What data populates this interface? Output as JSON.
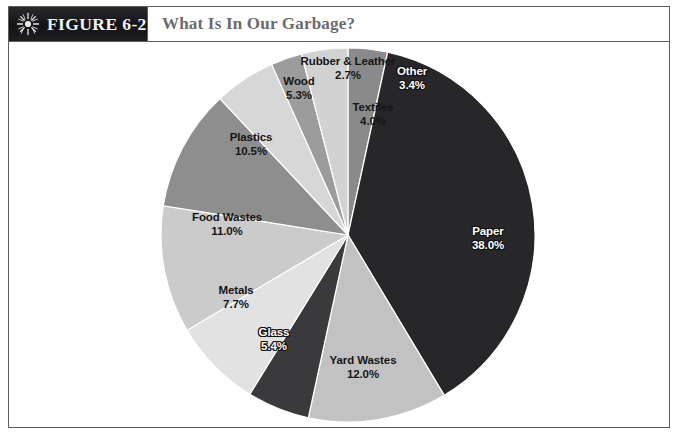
{
  "figure": {
    "tag_prefix": "F",
    "tag_label": "IGURE 6-2",
    "tag_full": "Figure 6-2",
    "title": "What Is In Our Garbage?",
    "icon": "sunburst-icon"
  },
  "colors": {
    "frame": "#5d5d5d",
    "tag_background": "#17171a",
    "tag_text": "#f2f2f2",
    "title_text": "#6b6b6b",
    "page_background": "#ffffff"
  },
  "chart_data": {
    "type": "pie",
    "title": "What Is In Our Garbage?",
    "xlabel": "",
    "ylabel": "",
    "units": "percent",
    "start_angle_deg": 0,
    "direction": "clockwise",
    "legend": "none",
    "labels_inline": true,
    "categories": [
      "Other",
      "Paper",
      "Yard Wastes",
      "Glass",
      "Metals",
      "Food Wastes",
      "Plastics",
      "Wood",
      "Rubber & Leather",
      "Textiles"
    ],
    "values": [
      3.4,
      38.0,
      12.0,
      5.4,
      7.7,
      11.0,
      10.5,
      5.3,
      2.7,
      4.0
    ],
    "total": 100.0,
    "slices": [
      {
        "name": "Other",
        "value": 3.4,
        "value_label": "3.4%",
        "color": "#8a8a8a",
        "label_on_dark": true,
        "label_x": 404,
        "label_y": 36,
        "line2": "3.4%"
      },
      {
        "name": "Paper",
        "value": 38.0,
        "value_label": "38.0%",
        "color": "#27272a",
        "label_on_dark": true,
        "label_x": 480,
        "label_y": 196,
        "line2": "38.0%"
      },
      {
        "name": "Yard Wastes",
        "value": 12.0,
        "value_label": "12.0%",
        "color": "#c2c2c2",
        "label_on_dark": false,
        "label_x": 355,
        "label_y": 325,
        "line2": "12.0%"
      },
      {
        "name": "Glass",
        "value": 5.4,
        "value_label": "5.4%",
        "color": "#3a3a3c",
        "label_on_dark": true,
        "label_x": 266,
        "label_y": 297,
        "line2": "5.4%"
      },
      {
        "name": "Metals",
        "value": 7.7,
        "value_label": "7.7%",
        "color": "#e2e2e2",
        "label_on_dark": false,
        "label_x": 228,
        "label_y": 255,
        "line2": "7.7%"
      },
      {
        "name": "Food Wastes",
        "value": 11.0,
        "value_label": "11.0%",
        "color": "#cbcbcb",
        "label_on_dark": false,
        "label_x": 219,
        "label_y": 182,
        "line2": "11.0%"
      },
      {
        "name": "Plastics",
        "value": 10.5,
        "value_label": "10.5%",
        "color": "#8e8e8e",
        "label_on_dark": false,
        "label_x": 243,
        "label_y": 102,
        "line2": "10.5%"
      },
      {
        "name": "Wood",
        "value": 5.3,
        "value_label": "5.3%",
        "color": "#d7d7d7",
        "label_on_dark": false,
        "label_x": 291,
        "label_y": 46,
        "line2": "5.3%"
      },
      {
        "name": "Rubber & Leather",
        "value": 2.7,
        "value_label": "2.7%",
        "color": "#9c9c9c",
        "label_on_dark": false,
        "label_x": 340,
        "label_y": 26,
        "line2": "2.7%"
      },
      {
        "name": "Textiles",
        "value": 4.0,
        "value_label": "4.0%",
        "color": "#d2d2d2",
        "label_on_dark": false,
        "label_x": 365,
        "label_y": 72,
        "line2": "4.0%"
      }
    ],
    "geometry": {
      "center_x": 340,
      "center_y": 193,
      "radius": 187
    }
  }
}
